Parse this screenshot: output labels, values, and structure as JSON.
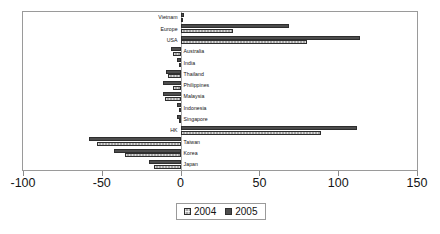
{
  "chart_data": {
    "type": "bar",
    "orientation": "horizontal",
    "title": "",
    "subtitle": "",
    "xlabel": "",
    "ylabel": "",
    "xlim": [
      -100,
      150
    ],
    "xticks": [
      -100,
      -50,
      0,
      50,
      100,
      150
    ],
    "xtick_labels": [
      "-100",
      "-50",
      "0",
      "50",
      "100",
      "150"
    ],
    "grid": false,
    "legend_position": "bottom",
    "categories": [
      "Vietnam",
      "Europe",
      "USA",
      "Australia",
      "India",
      "Thailand",
      "Philippines",
      "Malaysia",
      "Indonesia",
      "Singapore",
      "HK",
      "Taiwan",
      "Korea",
      "Japan"
    ],
    "series": [
      {
        "name": "2004",
        "color": "#a6a6a6",
        "values": [
          1,
          33,
          80,
          -5,
          -1,
          -8,
          -5,
          -10,
          -1,
          -1,
          89,
          -53,
          -35,
          -17
        ]
      },
      {
        "name": "2005",
        "color": "#4d4d4d",
        "values": [
          2,
          69,
          114,
          -6,
          -2,
          -9,
          -11,
          -11,
          -2,
          -2,
          112,
          -58,
          -42,
          -20
        ]
      }
    ]
  },
  "legend": {
    "items": [
      {
        "label": "2004",
        "swatch": "series-2004-swatch"
      },
      {
        "label": "2005",
        "swatch": "series-2005-swatch"
      }
    ]
  }
}
